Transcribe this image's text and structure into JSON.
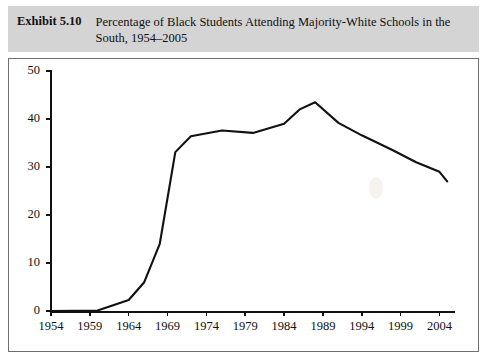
{
  "header": {
    "exhibit_label": "Exhibit 5.10",
    "title": "Percentage of Black Students Attending Majority-White Schools in the South, 1954–2005"
  },
  "chart_data": {
    "type": "line",
    "title": "Percentage of Black Students Attending Majority-White Schools in the South, 1954–2005",
    "xlabel": "",
    "ylabel": "",
    "xlim": [
      1954,
      2006
    ],
    "ylim": [
      0,
      50
    ],
    "ytick_labels": [
      "0",
      "10",
      "20",
      "30",
      "40",
      "50"
    ],
    "ytick_values": [
      0,
      10,
      20,
      30,
      40,
      50
    ],
    "xtick_labels": [
      "1954",
      "1959",
      "1964",
      "1969",
      "1974",
      "1979",
      "1984",
      "1989",
      "1994",
      "1999",
      "2004"
    ],
    "xtick_values": [
      1954,
      1959,
      1964,
      1969,
      1974,
      1979,
      1984,
      1989,
      1994,
      1999,
      2004
    ],
    "grid": false,
    "legend": false,
    "line_color": "#111111",
    "series": [
      {
        "name": "Percentage of Black students in majority-white schools",
        "x": [
          1954,
          1960,
          1964,
          1966,
          1968,
          1970,
          1972,
          1976,
          1980,
          1984,
          1986,
          1988,
          1991,
          1994,
          1998,
          2001,
          2004,
          2005
        ],
        "values": [
          0.0,
          0.1,
          2.3,
          6.0,
          14.0,
          33.1,
          36.4,
          37.6,
          37.1,
          39.0,
          42.0,
          43.5,
          39.2,
          36.6,
          33.5,
          31.0,
          29.0,
          27.0
        ]
      }
    ]
  }
}
